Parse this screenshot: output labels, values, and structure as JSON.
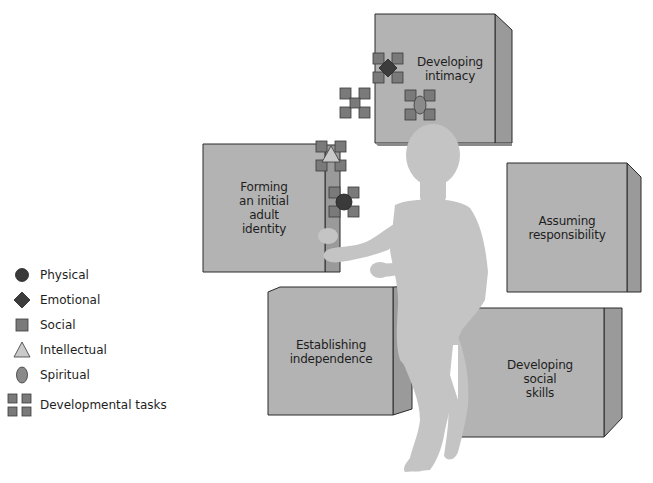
{
  "colors": {
    "box_face": "#b3b3b3",
    "box_side": "#9a9a9a",
    "box_edge": "#2a2a2a",
    "figure": "#c4c4c4",
    "social_square": "#7a7a7a",
    "physical_circle": "#3a3a3a",
    "emotional_diamond": "#3c3c3c",
    "intellectual_triangle": "#c9c9c9",
    "spiritual_ellipse": "#8a8a8a"
  },
  "boxes": [
    {
      "id": "intimacy",
      "label_lines": [
        "Developing",
        "intimacy"
      ]
    },
    {
      "id": "identity",
      "label_lines": [
        "Forming",
        "an initial",
        "adult",
        "identity"
      ]
    },
    {
      "id": "responsibility",
      "label_lines": [
        "Assuming",
        "responsibility"
      ]
    },
    {
      "id": "independence",
      "label_lines": [
        "Establishing",
        "independence"
      ]
    },
    {
      "id": "social-skills",
      "label_lines": [
        "Developing",
        "social",
        "skills"
      ]
    }
  ],
  "legend": {
    "items": [
      {
        "symbol": "circle-icon",
        "label": "Physical"
      },
      {
        "symbol": "diamond-icon",
        "label": "Emotional"
      },
      {
        "symbol": "square-icon",
        "label": "Social"
      },
      {
        "symbol": "triangle-icon",
        "label": "Intellectual"
      },
      {
        "symbol": "ellipse-icon",
        "label": "Spiritual"
      },
      {
        "symbol": "four-squares-icon",
        "label": "Developmental tasks"
      }
    ]
  }
}
